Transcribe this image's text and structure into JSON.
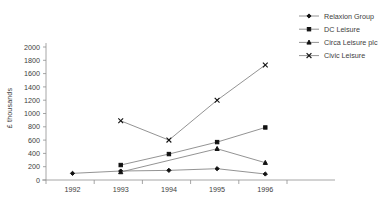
{
  "chart_data": {
    "type": "line",
    "title": "",
    "subtitle": "",
    "xlabel": "",
    "ylabel": "£ thousands",
    "categories": [
      "1992",
      "1993",
      "1994",
      "1995",
      "1996"
    ],
    "x": [
      1992,
      1993,
      1994,
      1995,
      1996
    ],
    "xlim": [
      1991.5,
      1996.5
    ],
    "ylim": [
      0,
      2000
    ],
    "y_ticks": [
      0,
      200,
      400,
      600,
      800,
      1000,
      1200,
      1400,
      1600,
      1800,
      2000
    ],
    "y_tick_labels": [
      "0",
      "200",
      "400",
      "600",
      "800",
      "1000",
      "1200",
      "1400",
      "1600",
      "1800",
      "2000"
    ],
    "grid": false,
    "legend_position": "top-right",
    "series": [
      {
        "name": "Relaxion Group",
        "marker": "diamond",
        "values": [
          100,
          135,
          145,
          170,
          90
        ]
      },
      {
        "name": "DC Leisure",
        "marker": "square",
        "values": [
          null,
          225,
          390,
          570,
          790
        ]
      },
      {
        "name": "Circa Leisure plc",
        "marker": "triangle",
        "values": [
          null,
          120,
          null,
          470,
          260
        ]
      },
      {
        "name": "Civic Leisure",
        "marker": "x",
        "values": [
          null,
          890,
          600,
          1200,
          1730
        ]
      }
    ]
  },
  "legend": {
    "items": [
      {
        "label": "Relaxion Group",
        "marker": "diamond"
      },
      {
        "label": "DC Leisure",
        "marker": "square"
      },
      {
        "label": "Circa Leisure plc",
        "marker": "triangle"
      },
      {
        "label": "Civic Leisure",
        "marker": "x"
      }
    ]
  },
  "axes": {
    "y_title": "£ thousands",
    "y_labels": [
      "2000",
      "1800",
      "1600",
      "1400",
      "1200",
      "1000",
      "800",
      "600",
      "400",
      "200",
      "0"
    ],
    "x_labels": [
      "1992",
      "1993",
      "1994",
      "1995",
      "1996"
    ]
  },
  "colors": {
    "line": "#777777",
    "marker": "#111111",
    "axis": "#8f8f8f",
    "text": "#3d3d3d",
    "background": "#ffffff"
  }
}
